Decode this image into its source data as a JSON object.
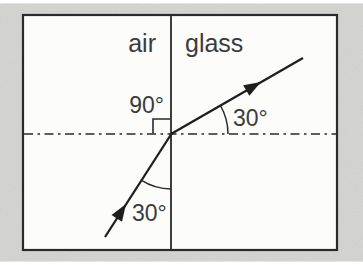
{
  "diagram": {
    "type": "light-refraction-at-air-glass-boundary",
    "media": {
      "left": "air",
      "right": "glass"
    },
    "labels": {
      "normal_angle": "90°",
      "refracted_angle": "30°",
      "incident_angle": "30°"
    },
    "colors": {
      "page_background": "#d7d7d4",
      "panel_fill": "#fcfcfb",
      "line": "#2a2a2a",
      "text": "#3b3b3b"
    }
  }
}
